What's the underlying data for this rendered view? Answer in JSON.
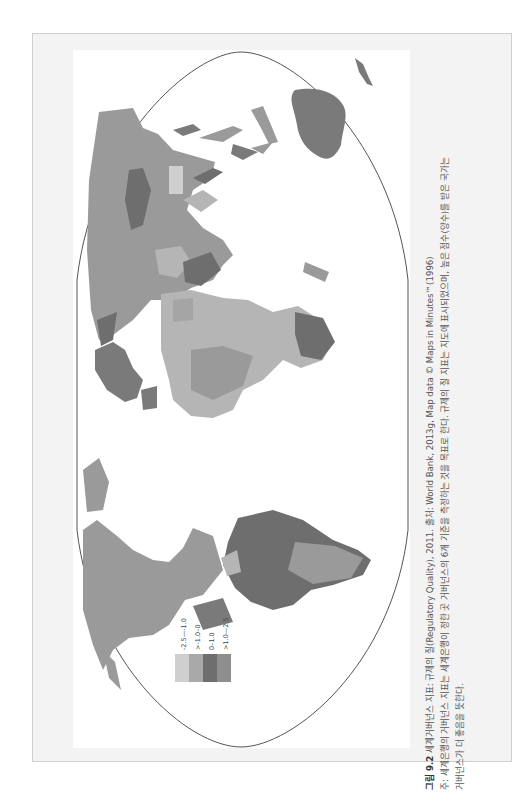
{
  "figure": {
    "number_label": "그림 9.2",
    "title": "세계거버넌스 지표: 규제의 질(Regulatory Quality), 2011. 출처: World Bank, 2013g, Map data © Maps in Minutes™(1996)",
    "note_line1": "주: 세계은행의 거버넌스 지표는 세계은행이 정한 곳 거버넌스의 6개 기준을 측정하는 것을 목표로 한다. 규제의 질 지표는 지도에 표시되었으며, 높은 점수(양수)를 받은 국가는",
    "note_line2": "거버넌스가 더 좋음을 뜻한다."
  },
  "legend": {
    "title": "",
    "items": [
      {
        "label": "-2.5—-1.0",
        "color": "#cfcfcf"
      },
      {
        "label": ">-1.0–0",
        "color": "#a9a9a9"
      },
      {
        "label": "0–1.0",
        "color": "#7c7c7c"
      },
      {
        "label": ">1.0—2.5",
        "color": "#939393"
      }
    ]
  },
  "map": {
    "projection": "world map rotated 90°, ellipse outline",
    "colors": {
      "outline": "#555555",
      "land_default": "#9a9a9a",
      "very_light": "#cfcfcf",
      "light": "#b5b5b5",
      "dark": "#6e6e6e"
    }
  }
}
